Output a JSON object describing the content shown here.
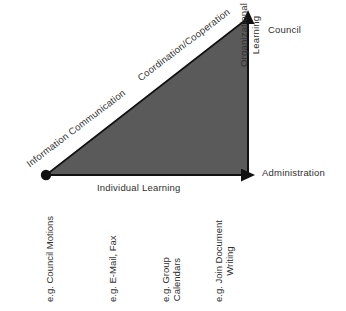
{
  "diagram": {
    "type": "triangle-growth-diagram",
    "colors": {
      "triangle_fill": "#5a5a5a",
      "axis": "#111111",
      "text": "#2f2f2f",
      "background": "#ffffff"
    },
    "axes": {
      "x_axis_label": "Individual Learning",
      "y_axis_label_line1": "Organizational",
      "y_axis_label_line2": "Learning",
      "y_axis_top_label": "Council",
      "y_axis_bottom_label": "Administration"
    },
    "hypotenuse_labels": [
      {
        "text": "Information Communication"
      },
      {
        "text": "Coordination/Cooperation"
      }
    ],
    "examples": [
      {
        "line1": "e.g. Council Motions",
        "line2": ""
      },
      {
        "line1": "e.g. E-Mail, Fax",
        "line2": ""
      },
      {
        "line1": "e.g. Group",
        "line2": "Calendars"
      },
      {
        "line1": "e.g. Join Document",
        "line2": "Writing"
      }
    ],
    "origin_marker": "filled-dot"
  }
}
